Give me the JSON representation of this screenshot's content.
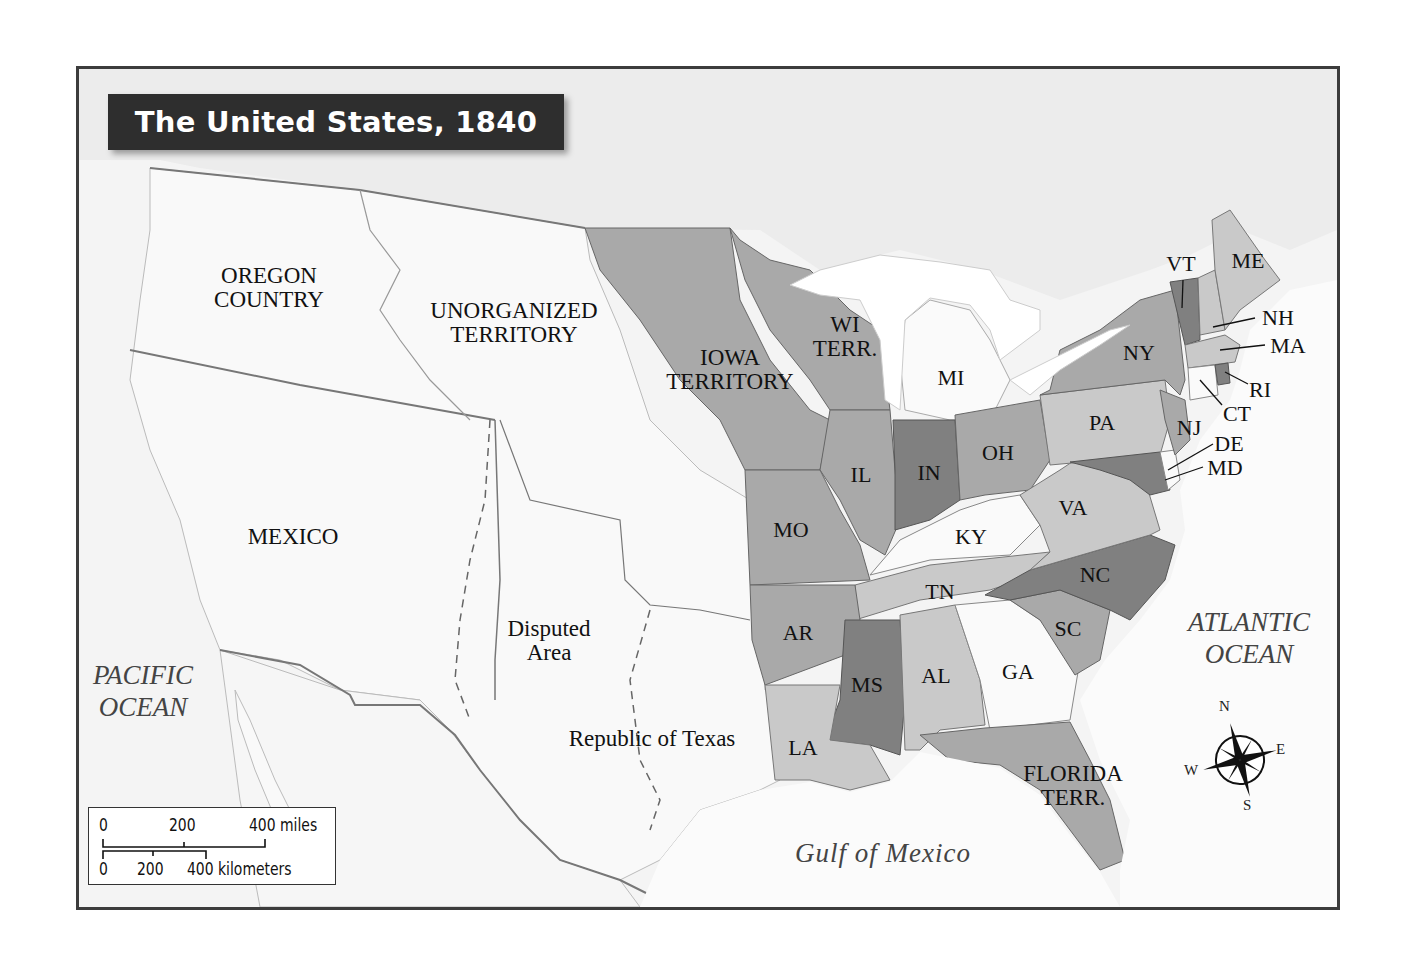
{
  "title": "The United States, 1840",
  "colors": {
    "frame": "#3c3c3c",
    "background": "#f4f4f4",
    "title_bg": "#2e2e2e",
    "unorganized": "#f7f7f7",
    "light_state": "#c9c9c9",
    "mid_state": "#a9a9a9",
    "dark_state": "#808080",
    "white_state": "#fafafa"
  },
  "regions": {
    "oregon": "OREGON\nCOUNTRY",
    "unorganized": "UNORGANIZED\nTERRITORY",
    "iowa": "IOWA\nTERRITORY",
    "wisconsin": "WI\nTERR.",
    "mexico": "MEXICO",
    "disputed": "Disputed\nArea",
    "texas": "Republic of Texas",
    "florida": "FLORIDA\nTERR."
  },
  "states": {
    "MI": "MI",
    "IL": "IL",
    "IN": "IN",
    "OH": "OH",
    "MO": "MO",
    "KY": "KY",
    "TN": "TN",
    "AR": "AR",
    "MS": "MS",
    "AL": "AL",
    "GA": "GA",
    "LA": "LA",
    "SC": "SC",
    "NC": "NC",
    "VA": "VA",
    "PA": "PA",
    "NY": "NY",
    "NJ": "NJ",
    "DE": "DE",
    "MD": "MD",
    "CT": "CT",
    "RI": "RI",
    "MA": "MA",
    "NH": "NH",
    "VT": "VT",
    "ME": "ME"
  },
  "oceans": {
    "pacific": "PACIFIC\nOCEAN",
    "atlantic": "ATLANTIC\nOCEAN",
    "gulf": "Gulf of Mexico"
  },
  "scale": {
    "miles": [
      "0",
      "200",
      "400 miles"
    ],
    "km": [
      "0",
      "200",
      "400 kilometers"
    ]
  },
  "compass": {
    "n": "N",
    "e": "E",
    "s": "S",
    "w": "W"
  }
}
